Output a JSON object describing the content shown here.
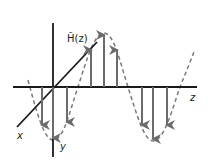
{
  "diagram": {
    "labels": {
      "field": "H̃(z)",
      "x_axis": "x",
      "y_axis": "y",
      "z_axis": "z"
    },
    "colors": {
      "axes": "#1a1a1a",
      "arrows": "#6b6b6b",
      "wave": "#7a7a7a",
      "background": "#ffffff"
    },
    "arrows": {
      "up_x": [
        91,
        104,
        117
      ],
      "down_x_first": [
        42,
        53,
        67
      ],
      "down_x_second": [
        142,
        153,
        167
      ]
    }
  }
}
